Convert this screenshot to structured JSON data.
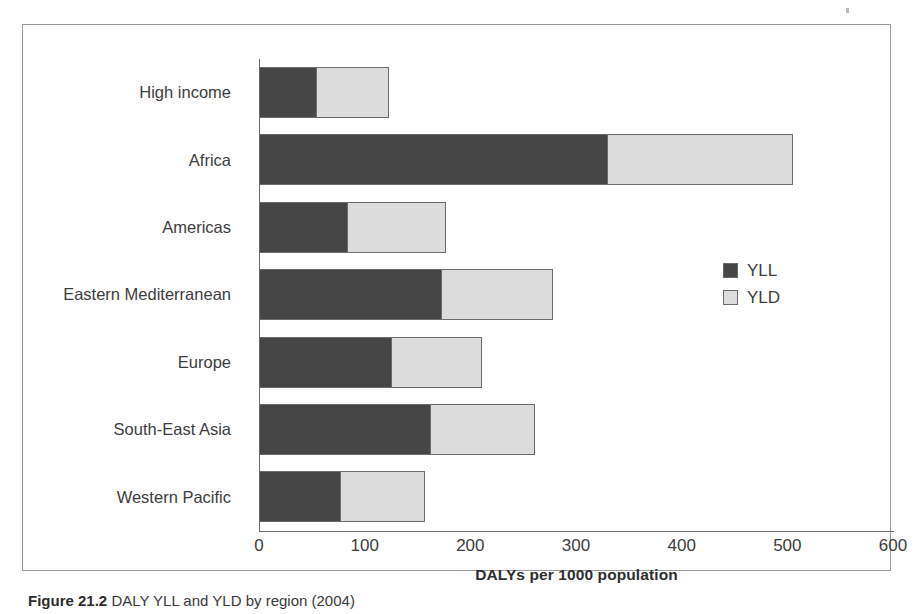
{
  "figure": {
    "caption_number": "Figure 21.2",
    "caption_text": "DALY YLL and YLD by region (2004)"
  },
  "legend": {
    "position": "right",
    "items": [
      {
        "label": "YLL",
        "color": "#464646"
      },
      {
        "label": "YLD",
        "color": "#dcdcdc"
      }
    ]
  },
  "chart_data": {
    "type": "bar",
    "orientation": "horizontal",
    "stacked": true,
    "title": "",
    "subtitle": "",
    "xlabel": "DALYs per 1000 population",
    "ylabel": "",
    "xlim": [
      0,
      600
    ],
    "ylim": null,
    "xticks": [
      0,
      100,
      200,
      300,
      400,
      500,
      600
    ],
    "xtick_labels": [
      "0",
      "100",
      "200",
      "300",
      "400",
      "500",
      "600"
    ],
    "grid": false,
    "legend_position": "right",
    "categories": [
      "High income",
      "Africa",
      "Americas",
      "Eastern Mediterranean",
      "Europe",
      "South-East Asia",
      "Western Pacific"
    ],
    "series": [
      {
        "name": "YLL",
        "color": "#464646",
        "values": [
          53,
          328,
          82,
          171,
          124,
          161,
          76
        ]
      },
      {
        "name": "YLD",
        "color": "#dcdcdc",
        "values": [
          70,
          177,
          95,
          107,
          87,
          100,
          81
        ]
      }
    ],
    "totals": [
      123,
      505,
      177,
      278,
      211,
      261,
      157
    ]
  }
}
